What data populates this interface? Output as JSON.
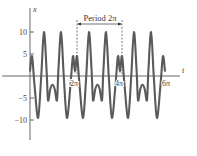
{
  "chart_data": {
    "type": "line",
    "title": "",
    "xlabel": "t",
    "ylabel": "x",
    "xlim_pi": [
      0,
      6
    ],
    "ylim": [
      -12,
      13
    ],
    "grid": false,
    "legend": null,
    "y_ticks": [
      {
        "value": 10,
        "label": "10"
      },
      {
        "value": 5,
        "label": "5"
      },
      {
        "value": -5,
        "label": "−5"
      },
      {
        "value": -10,
        "label": "−10"
      }
    ],
    "x_ticks": [
      {
        "value_pi": 2,
        "label": "2π"
      },
      {
        "value_pi": 4,
        "label": "4π"
      },
      {
        "value_pi": 6,
        "label": "6π"
      }
    ],
    "annotation": {
      "label": "Period 2π",
      "from_pi": 2,
      "to_pi": 4
    },
    "period_pi": 2,
    "periods_shown": 3,
    "one_period_samples": {
      "t_over_pi": [
        0,
        0.09,
        0.2,
        0.36,
        0.5,
        0.62,
        0.74,
        0.8,
        0.9,
        1.0,
        1.1,
        1.2,
        1.26,
        1.38,
        1.5,
        1.64,
        1.8,
        1.91,
        2.0
      ],
      "x": [
        1,
        4.5,
        -2,
        -9.5,
        0,
        10,
        1,
        -5.5,
        -3,
        -2,
        -3,
        -5.5,
        1,
        10,
        0,
        -9.5,
        -2,
        4.5,
        1
      ]
    }
  },
  "colors": {
    "curve": "#5a5a5a",
    "axis": "#555555"
  }
}
